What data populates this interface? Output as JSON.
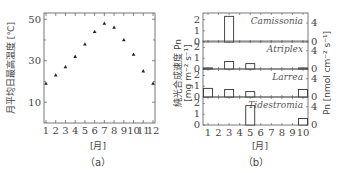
{
  "chart_data": [
    {
      "panel": "(a)",
      "type": "scatter",
      "xlabel": "[月]",
      "ylabel": "月平均日最高温度 [℃]",
      "x": [
        1,
        2,
        3,
        4,
        5,
        6,
        7,
        8,
        9,
        10,
        11,
        12
      ],
      "values": [
        19,
        23,
        27,
        32,
        38,
        44,
        48,
        46,
        40,
        33,
        25,
        19
      ],
      "yticks": [
        10,
        30,
        50
      ],
      "xticks": [
        "1",
        "2",
        "3",
        "4",
        "5",
        "6",
        "7",
        "8",
        "9",
        "10",
        "11",
        "12"
      ],
      "ylim": [
        0,
        53
      ],
      "marker": "triangle"
    },
    {
      "panel": "(b)",
      "type": "bar",
      "xlabel": "[月]",
      "ylabel_left": "純光合成速度 Pn [mg m⁻² s⁻¹]",
      "ylabel_right": "Pn [nmol cm⁻² s⁻¹]",
      "xticks": [
        "1",
        "2",
        "3",
        "4",
        "5",
        "6",
        "7",
        "8",
        "9",
        "10"
      ],
      "yticks_left": [
        "0",
        "1",
        "2"
      ],
      "yticks_right": [
        "0",
        "4"
      ],
      "ylim": [
        0,
        2.6
      ],
      "series": [
        {
          "name": "Camissonia",
          "values": [
            0,
            0,
            2.3,
            0,
            0,
            0,
            0,
            0,
            0,
            0
          ]
        },
        {
          "name": "Atriplex",
          "values": [
            0.1,
            0,
            0.7,
            0,
            0.5,
            0,
            0,
            0,
            0,
            0.1
          ]
        },
        {
          "name": "Larrea",
          "values": [
            0.8,
            0,
            0.7,
            0,
            0.5,
            0,
            0,
            0,
            0,
            0.7
          ]
        },
        {
          "name": "Tidestromia",
          "values": [
            0,
            0,
            0,
            0,
            1.8,
            0,
            0,
            0,
            0,
            0.6
          ]
        }
      ]
    }
  ],
  "captions": {
    "a": "（a）",
    "b": "（b）"
  },
  "labels": {
    "a_ylabel": "月平均日最高温度 [℃]",
    "a_xlabel": "[月]",
    "b_xlabel": "[月]",
    "b_ylabel_main": "純光合成速度 Pn",
    "b_ylabel_unit": "[mg m⁻² s⁻¹]",
    "b_ylabel_right": "Pn [nmol cm⁻² s⁻¹]"
  }
}
